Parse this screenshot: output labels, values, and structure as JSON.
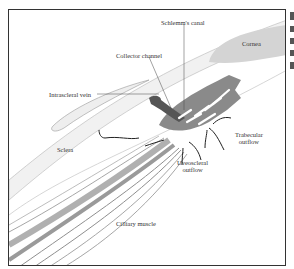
{
  "diagram": {
    "labels": {
      "schlemms_canal": "Schlemm's canal",
      "cornea": "Cornea",
      "collector_channel": "Collector channel",
      "intrascleral_vein": "Intrascleral vein",
      "trabecular_outflow_line1": "Trabecular",
      "trabecular_outflow_line2": "outflow",
      "sclera": "Sclera",
      "uveoscleral_outflow_line1": "Uveoscleral",
      "uveoscleral_outflow_line2": "outflow",
      "ciliary_muscle": "Cilliary muscle"
    },
    "colors": {
      "frame": "#333333",
      "trabecular_meshwork": "#8a8a8a",
      "schlemms_canal": "#666666",
      "cornea": "#d4d4d4",
      "muscle": "#9a9a9a",
      "arrows": "#222222"
    }
  }
}
